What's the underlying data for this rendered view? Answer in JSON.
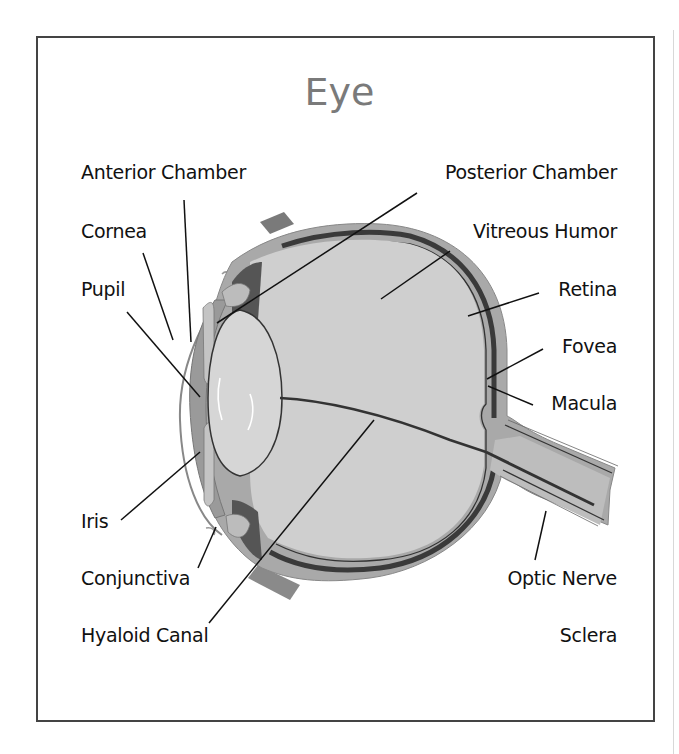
{
  "diagram": {
    "title": "Eye",
    "labels": {
      "anterior_chamber": "Anterior Chamber",
      "posterior_chamber": "Posterior Chamber",
      "cornea": "Cornea",
      "vitreous_humor": "Vitreous Humor",
      "pupil": "Pupil",
      "retina": "Retina",
      "fovea": "Fovea",
      "macula": "Macula",
      "iris": "Iris",
      "conjunctiva": "Conjunctiva",
      "optic_nerve": "Optic Nerve",
      "hyaloid_canal": "Hyaloid Canal",
      "sclera": "Sclera"
    },
    "colors": {
      "frame": "#444444",
      "title": "#7a7a7a",
      "sclera": "#a9a9a9",
      "choroid": "#3a3a3a",
      "vitreous": "#cfcfcf",
      "lens": "#d6d6d6",
      "cornea": "#9a9a9a",
      "leader": "#111111"
    }
  }
}
